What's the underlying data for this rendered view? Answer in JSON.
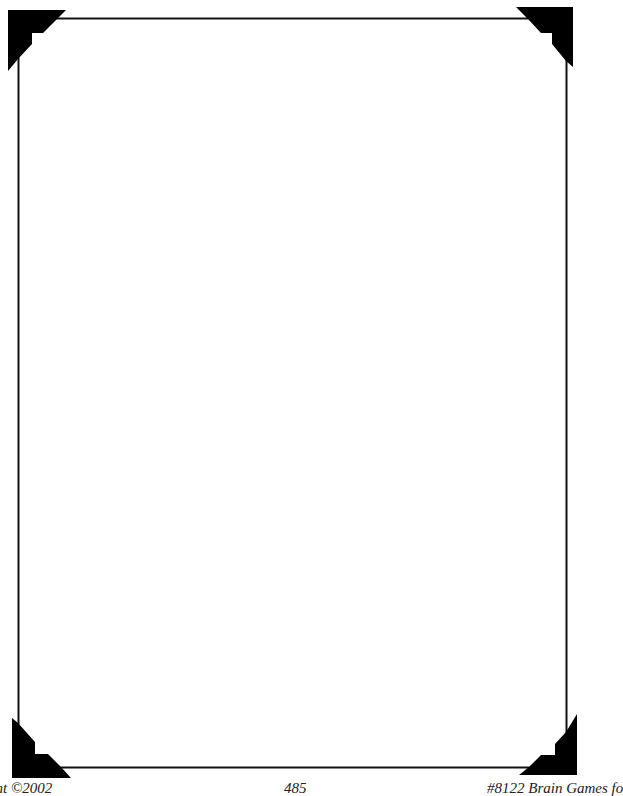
{
  "page": {
    "type": "blank bordered worksheet page",
    "border_color": "#111111",
    "corner_color": "#000000",
    "background": "#ffffff"
  },
  "footer": {
    "left": "right ©2002",
    "center": "485",
    "right": "#8122 Brain Games fo"
  }
}
